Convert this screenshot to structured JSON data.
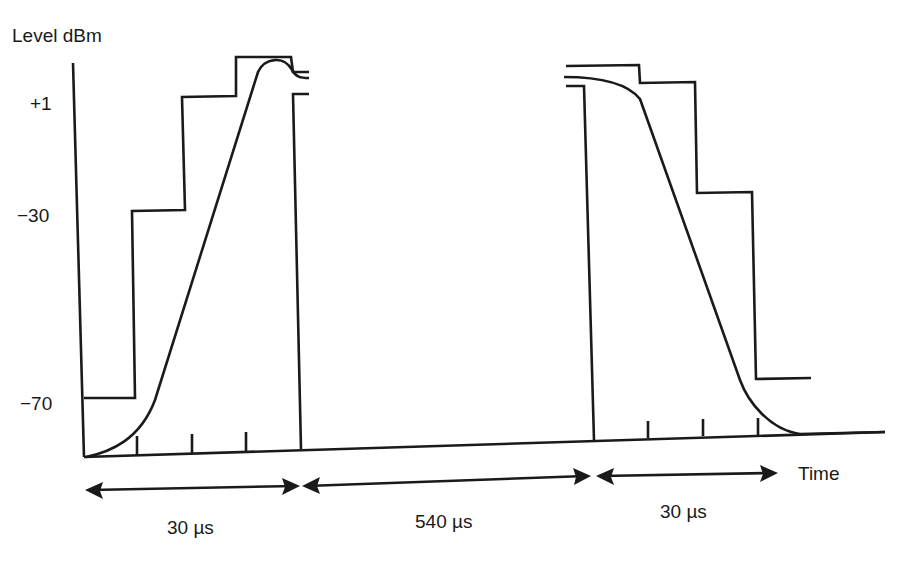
{
  "diagram": {
    "y_axis_label": "Level dBm",
    "x_axis_label": "Time",
    "y_ticks": [
      {
        "label": "+1"
      },
      {
        "label": "−30"
      },
      {
        "label": "−70"
      }
    ],
    "durations": [
      {
        "label": "30 µs",
        "segment": "ramp-up"
      },
      {
        "label": "540 µs",
        "segment": "burst"
      },
      {
        "label": "30 µs",
        "segment": "ramp-down"
      }
    ],
    "elements": {
      "mask": "stepped power/time template (upper limit)",
      "curve": "burst power envelope (ramp up, flat, ramp down)"
    },
    "colors": {
      "line": "#1a1a1a",
      "background": "#ffffff"
    }
  }
}
